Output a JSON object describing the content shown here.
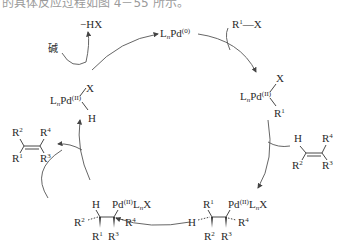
{
  "caption_fragment": "的具体反应过程如图 4－55 所示。",
  "cycle": {
    "catalyst": {
      "base": "L",
      "sub": "n",
      "metal": "Pd",
      "ox": "(0)"
    },
    "reagent_in": {
      "r": "R",
      "r_sup": "1",
      "rest": "—X"
    },
    "byproduct_out": "−HX",
    "base_label": "碱",
    "oxidative_adduct": {
      "metal": "LnPd(II)",
      "ligand_top": "X",
      "ligand_bottom": "R1"
    },
    "alkene_reactant": {
      "h": "H",
      "r2": "R",
      "r2_sup": "2",
      "r4": "R",
      "r4_sup": "4",
      "r3": "R",
      "r3_sup": "3"
    },
    "insertion_intermediate": {
      "r1": "R",
      "r1_sup": "1",
      "h": "H",
      "r2": "R",
      "r2_sup": "2",
      "r3": "R",
      "r3_sup": "3",
      "r4": "R",
      "r4_sup": "4",
      "pd": "Pd",
      "pd_ox": "(II)",
      "ln": "L",
      "ln_sub": "n",
      "x": "X"
    },
    "rotated_intermediate": {
      "h": "H",
      "r2": "R",
      "r2_sup": "2",
      "r1": "R",
      "r1_sup": "1",
      "r3": "R",
      "r3_sup": "3",
      "r4": "R",
      "r4_sup": "4",
      "pd": "Pd",
      "pd_ox": "(II)",
      "ln": "L",
      "ln_sub": "n",
      "x": "X"
    },
    "hydride_complex": {
      "metal": "Pd",
      "ox": "(II)",
      "x": "X",
      "h": "H"
    },
    "alkene_product": {
      "r1": "R",
      "r1_sup": "1",
      "r2": "R",
      "r2_sup": "2",
      "r3": "R",
      "r3_sup": "3",
      "r4": "R",
      "r4_sup": "4"
    }
  }
}
